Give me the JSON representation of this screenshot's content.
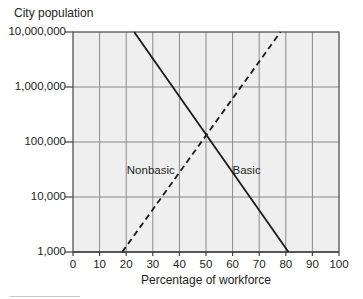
{
  "chart_data": {
    "type": "line",
    "title": "",
    "xlabel": "Percentage of workforce",
    "ylabel": "City population",
    "yscale": "log",
    "xlim": [
      0,
      100
    ],
    "ylim": [
      1000,
      10000000
    ],
    "grid": true,
    "legend": "inline labels",
    "x_ticks": [
      "0",
      "10",
      "20",
      "30",
      "40",
      "50",
      "60",
      "70",
      "80",
      "90",
      "100"
    ],
    "y_ticks": [
      "1,000",
      "10,000",
      "100,000",
      "1,000,000",
      "10,000,000"
    ],
    "series": [
      {
        "name": "Basic",
        "style": "solid",
        "points": [
          {
            "x": 23,
            "y": 10000000
          },
          {
            "x": 81,
            "y": 1000
          }
        ],
        "label_position": {
          "x": 66,
          "y": 30000
        }
      },
      {
        "name": "Nonbasic",
        "style": "dashed",
        "points": [
          {
            "x": 18.5,
            "y": 1000
          },
          {
            "x": 78,
            "y": 10000000
          }
        ],
        "label_position": {
          "x": 30,
          "y": 30000
        }
      }
    ],
    "intersection": {
      "x": 50.5,
      "y": 150000
    }
  },
  "colors": {
    "plot_background": "#efefef",
    "grid": "#8a8a8a",
    "axis": "#444444",
    "lines": "#1a1a1a",
    "text": "#231f20"
  }
}
